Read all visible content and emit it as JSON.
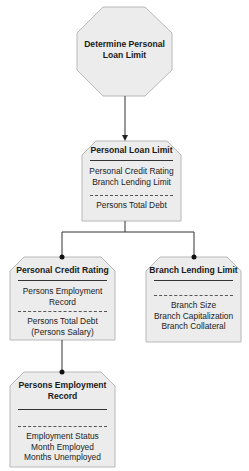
{
  "diagram": {
    "type": "hierarchy",
    "colors": {
      "fill": "#ececec",
      "stroke": "#b8b8b8",
      "connector": "#333333",
      "text": "#1a1a1a"
    },
    "root": {
      "shape": "octagon",
      "label_lines": [
        "Determine Personal",
        "Loan Limit"
      ]
    },
    "nodes": [
      {
        "id": "personal-loan-limit",
        "title_lines": [
          "Personal Loan Limit"
        ],
        "inputs": [
          "Personal Credit Rating",
          "Branch Lending Limit"
        ],
        "data": [
          "Persons Total Debt"
        ]
      },
      {
        "id": "personal-credit-rating",
        "title_lines": [
          "Personal Credit Rating"
        ],
        "inputs": [
          "Persons Employment",
          "Record"
        ],
        "data": [
          "Persons Total Debt",
          "(Persons Salary)"
        ]
      },
      {
        "id": "branch-lending-limit",
        "title_lines": [
          "Branch Lending Limit"
        ],
        "inputs": [],
        "data": [
          "Branch Size",
          "Branch Capitalization",
          "Branch Collateral"
        ]
      },
      {
        "id": "persons-employment-record",
        "title_lines": [
          "Persons Employment",
          "Record"
        ],
        "inputs": [],
        "data": [
          "Employment Status",
          "Month Employed",
          "Months Unemployed"
        ]
      }
    ],
    "edges": [
      {
        "from": "root",
        "to": "personal-loan-limit",
        "end": "arrow"
      },
      {
        "from": "personal-loan-limit",
        "to": "personal-credit-rating",
        "end": "dot"
      },
      {
        "from": "personal-loan-limit",
        "to": "branch-lending-limit",
        "end": "dot"
      },
      {
        "from": "personal-credit-rating",
        "to": "persons-employment-record",
        "end": "dot"
      }
    ]
  }
}
